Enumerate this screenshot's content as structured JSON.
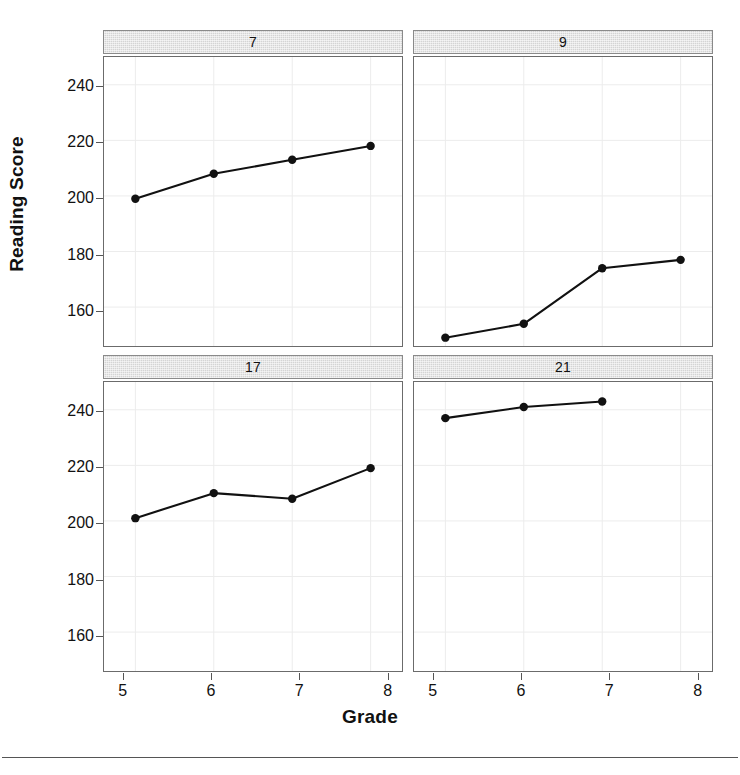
{
  "chart_data": {
    "type": "line",
    "title": "",
    "xlabel": "Grade",
    "ylabel": "Reading Score",
    "layout": "2x2 trellis / faceted panels",
    "grid": true,
    "legend": "none",
    "xlim": [
      4.6,
      8.4
    ],
    "ylim": [
      146,
      250
    ],
    "x_ticks": [
      5,
      6,
      7,
      8
    ],
    "y_ticks": [
      160,
      180,
      200,
      220,
      240
    ],
    "marker": "filled-circle",
    "line_color": "#111111",
    "marker_color": "#111111",
    "panels": [
      {
        "strip_label": "7",
        "x": [
          5,
          6,
          7,
          8
        ],
        "values": [
          199,
          208,
          213,
          218
        ]
      },
      {
        "strip_label": "9",
        "x": [
          5,
          6,
          7,
          8
        ],
        "values": [
          149,
          154,
          174,
          177
        ]
      },
      {
        "strip_label": "17",
        "x": [
          5,
          6,
          7,
          8
        ],
        "values": [
          201,
          210,
          208,
          219
        ]
      },
      {
        "strip_label": "21",
        "x": [
          5,
          6,
          7
        ],
        "values": [
          237,
          241,
          243
        ]
      }
    ]
  },
  "axes": {
    "y_title": "Reading Score",
    "x_title": "Grade",
    "y_tick_labels": [
      "240",
      "220",
      "200",
      "180",
      "160"
    ],
    "x_tick_labels": [
      "5",
      "6",
      "7",
      "8"
    ]
  },
  "strips": {
    "top_left": "7",
    "top_right": "9",
    "bottom_left": "17",
    "bottom_right": "21"
  }
}
